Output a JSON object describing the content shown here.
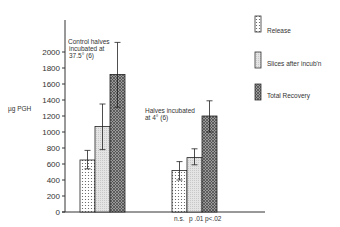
{
  "chart_data": {
    "type": "bar",
    "title": "",
    "ylabel": "µg PGH",
    "xlabel": "",
    "ylim": [
      0,
      2200
    ],
    "yticks": [
      0,
      200,
      400,
      600,
      800,
      1000,
      1200,
      1400,
      1600,
      1800,
      2000
    ],
    "grid": false,
    "legend_position": "right",
    "categories": [
      "Control halves incubated at 37.5° (6)",
      "Halves incubated at 4° (6)"
    ],
    "series": [
      {
        "name": "Release",
        "values": [
          650,
          520
        ],
        "err_low": [
          540,
          400
        ],
        "err_high": [
          770,
          630
        ],
        "pattern": "dots"
      },
      {
        "name": "Slices after incub'n",
        "values": [
          1070,
          680
        ],
        "err_low": [
          780,
          590
        ],
        "err_high": [
          1350,
          790
        ],
        "pattern": "light-stipple"
      },
      {
        "name": "Total Recovery",
        "values": [
          1720,
          1200
        ],
        "err_low": [
          1310,
          1000
        ],
        "err_high": [
          2120,
          1390
        ],
        "pattern": "crosshatch"
      }
    ],
    "annotations": [
      {
        "text": "Control halves",
        "group": 0
      },
      {
        "text": "incubated at",
        "group": 0
      },
      {
        "text": "37.5° (6)",
        "group": 0
      },
      {
        "text": "Halves incubated",
        "group": 1
      },
      {
        "text": "at 4° (6)",
        "group": 1
      },
      {
        "text": "n.s.",
        "group": 1,
        "series": 0
      },
      {
        "text": "p .01",
        "group": 1,
        "series": 1
      },
      {
        "text": "p<.02",
        "group": 1,
        "series": 2
      }
    ]
  },
  "labels": {
    "ylabel": "µg PGH",
    "group1_line1": "Control halves",
    "group1_line2": "incubated at",
    "group1_line3": "37.5° (6)",
    "group2_line1": "Halves incubated",
    "group2_line2": "at 4° (6)",
    "sig1": "n.s.",
    "sig2": "p .01",
    "sig3": "p<.02"
  },
  "legend": {
    "items": [
      {
        "label": "Release"
      },
      {
        "label": "Slices after incub'n"
      },
      {
        "label": "Total Recovery"
      }
    ]
  },
  "ticks": [
    "0",
    "200",
    "400",
    "600",
    "800",
    "1000",
    "1200",
    "1400",
    "1600",
    "1800",
    "2000"
  ]
}
